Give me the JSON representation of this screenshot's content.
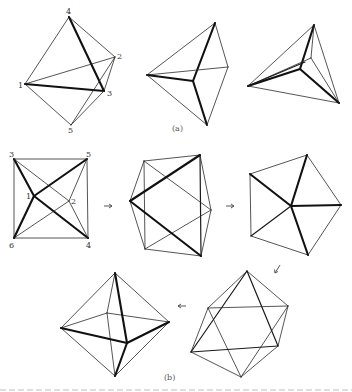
{
  "figure": {
    "part_labels": {
      "a": "(a)",
      "b": "(b)"
    },
    "vertex_labels": {
      "a1": {
        "v4": "4",
        "v2": "2",
        "v1": "1",
        "v3": "3",
        "v5": "5"
      },
      "b1": {
        "v3": "3",
        "v5": "5",
        "v1": "1",
        "v2": "2",
        "v6": "6",
        "v4": "4"
      }
    },
    "arrows": [
      {
        "from": "b1",
        "to": "b2",
        "glyph": "right-arrow"
      },
      {
        "from": "b2",
        "to": "b3",
        "glyph": "right-arrow"
      },
      {
        "from": "b3",
        "to": "b4",
        "glyph": "down-left-arrow"
      },
      {
        "from": "b4",
        "to": "b5",
        "glyph": "left-arrow"
      }
    ],
    "panels": [
      {
        "id": "a1",
        "description": "trigonal bipyramid with labeled vertices 1-5"
      },
      {
        "id": "a2",
        "description": "rotated trigonal bipyramid"
      },
      {
        "id": "a3",
        "description": "tetrahedral-like projection"
      },
      {
        "id": "b1",
        "description": "square projection of octahedron with labeled vertices 1-6"
      },
      {
        "id": "b2",
        "description": "hexagonal projection"
      },
      {
        "id": "b3",
        "description": "pentagonal projection"
      },
      {
        "id": "b4",
        "description": "octahedron viewed along 3-fold axis"
      },
      {
        "id": "b5",
        "description": "octahedron standard view"
      }
    ]
  }
}
